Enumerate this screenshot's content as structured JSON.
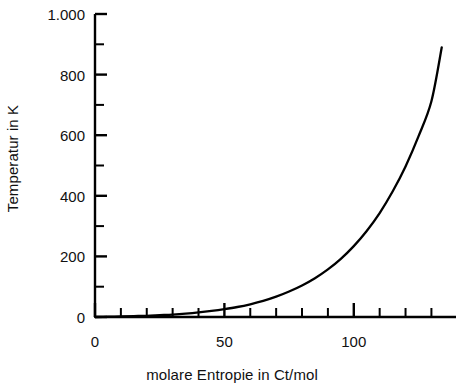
{
  "chart_data": {
    "type": "line",
    "title": "",
    "xlabel": "molare Entropie in Ct/mol",
    "ylabel": "Temperatur in K",
    "xlim": [
      0,
      139.5
    ],
    "ylim": [
      0,
      1000
    ],
    "grid": false,
    "legend": null,
    "x_ticks_major": [
      {
        "value": 0,
        "label": "0"
      },
      {
        "value": 50,
        "label": "50"
      },
      {
        "value": 100,
        "label": "100"
      }
    ],
    "x_ticks_minor": [
      10,
      20,
      30,
      40,
      60,
      70,
      80,
      90,
      110,
      120,
      130
    ],
    "y_ticks_major": [
      {
        "value": 0,
        "label": "0"
      },
      {
        "value": 200,
        "label": "200"
      },
      {
        "value": 400,
        "label": "400"
      },
      {
        "value": 600,
        "label": "600"
      },
      {
        "value": 800,
        "label": "800"
      },
      {
        "value": 1000,
        "label": "1.000"
      }
    ],
    "y_ticks_minor": [
      100,
      300,
      500,
      700,
      900
    ],
    "series": [
      {
        "name": "Temperatur",
        "color": "#000000",
        "x": [
          0,
          5,
          10,
          15,
          20,
          25,
          30,
          35,
          40,
          45,
          50,
          55,
          60,
          65,
          70,
          75,
          80,
          85,
          90,
          95,
          100,
          105,
          110,
          115,
          120,
          125,
          130,
          134
        ],
        "y": [
          0,
          1,
          2,
          3,
          4,
          6,
          8,
          11,
          15,
          20,
          26,
          33,
          42,
          53,
          67,
          84,
          104,
          128,
          157,
          192,
          234,
          284,
          343,
          414,
          497,
          596,
          712,
          890
        ]
      }
    ]
  }
}
